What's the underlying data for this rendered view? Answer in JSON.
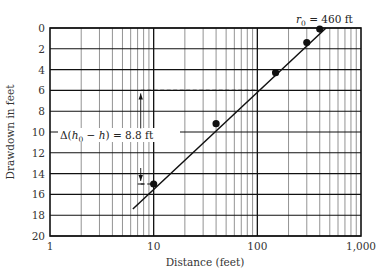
{
  "chart_data": {
    "type": "scatter",
    "title": "",
    "xlabel": "Distance (feet)",
    "ylabel": "Drawdown in feet",
    "x_scale": "log",
    "xlim": [
      1,
      1000
    ],
    "ylim": [
      0,
      20
    ],
    "y_inverted": true,
    "x_ticks": [
      "1",
      "10",
      "100",
      "1,000"
    ],
    "y_ticks": [
      "0",
      "2",
      "4",
      "6",
      "8",
      "10",
      "12",
      "14",
      "16",
      "18",
      "20"
    ],
    "grid": true,
    "series": [
      {
        "name": "Observed drawdown",
        "x": [
          10,
          40,
          150,
          300,
          400
        ],
        "y": [
          15.0,
          9.2,
          4.3,
          1.4,
          0.1
        ]
      }
    ],
    "fit_line": {
      "name": "Best-fit straight line",
      "x": [
        6.3,
        460
      ],
      "y": [
        17.4,
        0
      ]
    },
    "annotations": [
      {
        "text": "r0 = 460 ft",
        "display_main": "r",
        "display_sub": "0",
        "display_rest": " = 460 ft",
        "x": 460,
        "y": 0
      },
      {
        "text": "Δ(h0 − h) = 8.8 ft",
        "display_a": "Δ(",
        "display_h": "h",
        "display_sub": "0",
        "display_b": " − ",
        "display_h2": "h",
        "display_c": ") = 8.8 ft",
        "from_y": 15.0,
        "to_y": 6.0,
        "x": 7.5
      }
    ],
    "reference_lines": [
      {
        "type": "dashed-horizontal",
        "y": 6.0,
        "x_from": 7.5,
        "x_to": 100
      },
      {
        "type": "dashed-horizontal",
        "y": 15.0,
        "x_from": 7.5,
        "x_to": 10
      }
    ]
  }
}
